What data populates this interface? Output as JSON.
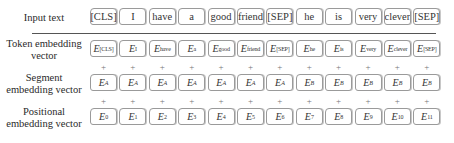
{
  "rows": {
    "input": {
      "label": "Input text",
      "tokens": [
        "[CLS]",
        "I",
        "have",
        "a",
        "good",
        "friend",
        "[SEP]",
        "he",
        "is",
        "very",
        "clever",
        "[SEP]"
      ]
    },
    "token": {
      "label_line1": "Token embedding",
      "label_line2": "vector",
      "base": "E",
      "subs": [
        "[CLS]",
        "I",
        "have",
        "a",
        "good",
        "friend",
        "[SEP]",
        "he",
        "is",
        "very",
        "clever",
        "[SEP]"
      ]
    },
    "segment": {
      "label_line1": "Segment",
      "label_line2": "embedding vector",
      "base": "E",
      "subs": [
        "A",
        "A",
        "A",
        "A",
        "A",
        "A",
        "A",
        "B",
        "B",
        "B",
        "B",
        "B"
      ]
    },
    "position": {
      "label_line1": "Positional",
      "label_line2": "embedding vector",
      "base": "E",
      "subs": [
        "0",
        "1",
        "2",
        "3",
        "4",
        "5",
        "6",
        "7",
        "8",
        "9",
        "10",
        "11"
      ]
    }
  },
  "operator": "+"
}
